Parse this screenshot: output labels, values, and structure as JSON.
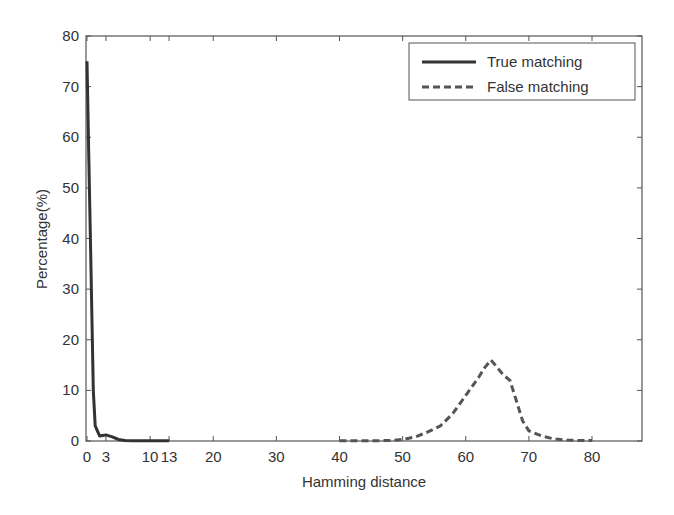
{
  "chart_data": {
    "type": "line",
    "title": "",
    "xlabel": "Hamming distance",
    "ylabel": "Percentage(%)",
    "xlim": [
      0,
      88
    ],
    "ylim": [
      0,
      80
    ],
    "grid": false,
    "legend_position": "upper right",
    "x_ticks": [
      0,
      3,
      10,
      13,
      20,
      30,
      40,
      50,
      60,
      70,
      80
    ],
    "x_tick_labels": [
      "0",
      "3",
      "10",
      "13",
      "20",
      "30",
      "40",
      "50",
      "60",
      "70",
      "80"
    ],
    "y_ticks": [
      0,
      10,
      20,
      30,
      40,
      50,
      60,
      70,
      80
    ],
    "y_tick_labels": [
      "0",
      "10",
      "20",
      "30",
      "40",
      "50",
      "60",
      "70",
      "80"
    ],
    "series": [
      {
        "name": "True matching",
        "style": "solid",
        "color": "#333333",
        "x": [
          0,
          0.3,
          0.6,
          1,
          1.3,
          2,
          3,
          4,
          5,
          6,
          7,
          8,
          9,
          10,
          11,
          12,
          13
        ],
        "y": [
          75,
          55,
          36,
          10,
          3,
          1,
          1.2,
          0.8,
          0.3,
          0.1,
          0.05,
          0.05,
          0.05,
          0.05,
          0.05,
          0.05,
          0.05
        ]
      },
      {
        "name": "False matching",
        "style": "dashed",
        "color": "#555555",
        "x": [
          40,
          42,
          44,
          46,
          48,
          50,
          52,
          54,
          56,
          58,
          60,
          62,
          63,
          64,
          65,
          66,
          67,
          68,
          69,
          70,
          72,
          74,
          76,
          78,
          80
        ],
        "y": [
          0.05,
          0.05,
          0.05,
          0.05,
          0.1,
          0.3,
          0.8,
          1.8,
          3,
          5.5,
          9,
          12.5,
          14.5,
          16,
          14.5,
          13,
          12,
          8,
          4,
          2,
          1,
          0.4,
          0.2,
          0.1,
          0.1
        ]
      }
    ]
  },
  "legend": {
    "items": [
      {
        "label": "True matching",
        "style": "solid"
      },
      {
        "label": "False matching",
        "style": "dashed"
      }
    ]
  }
}
